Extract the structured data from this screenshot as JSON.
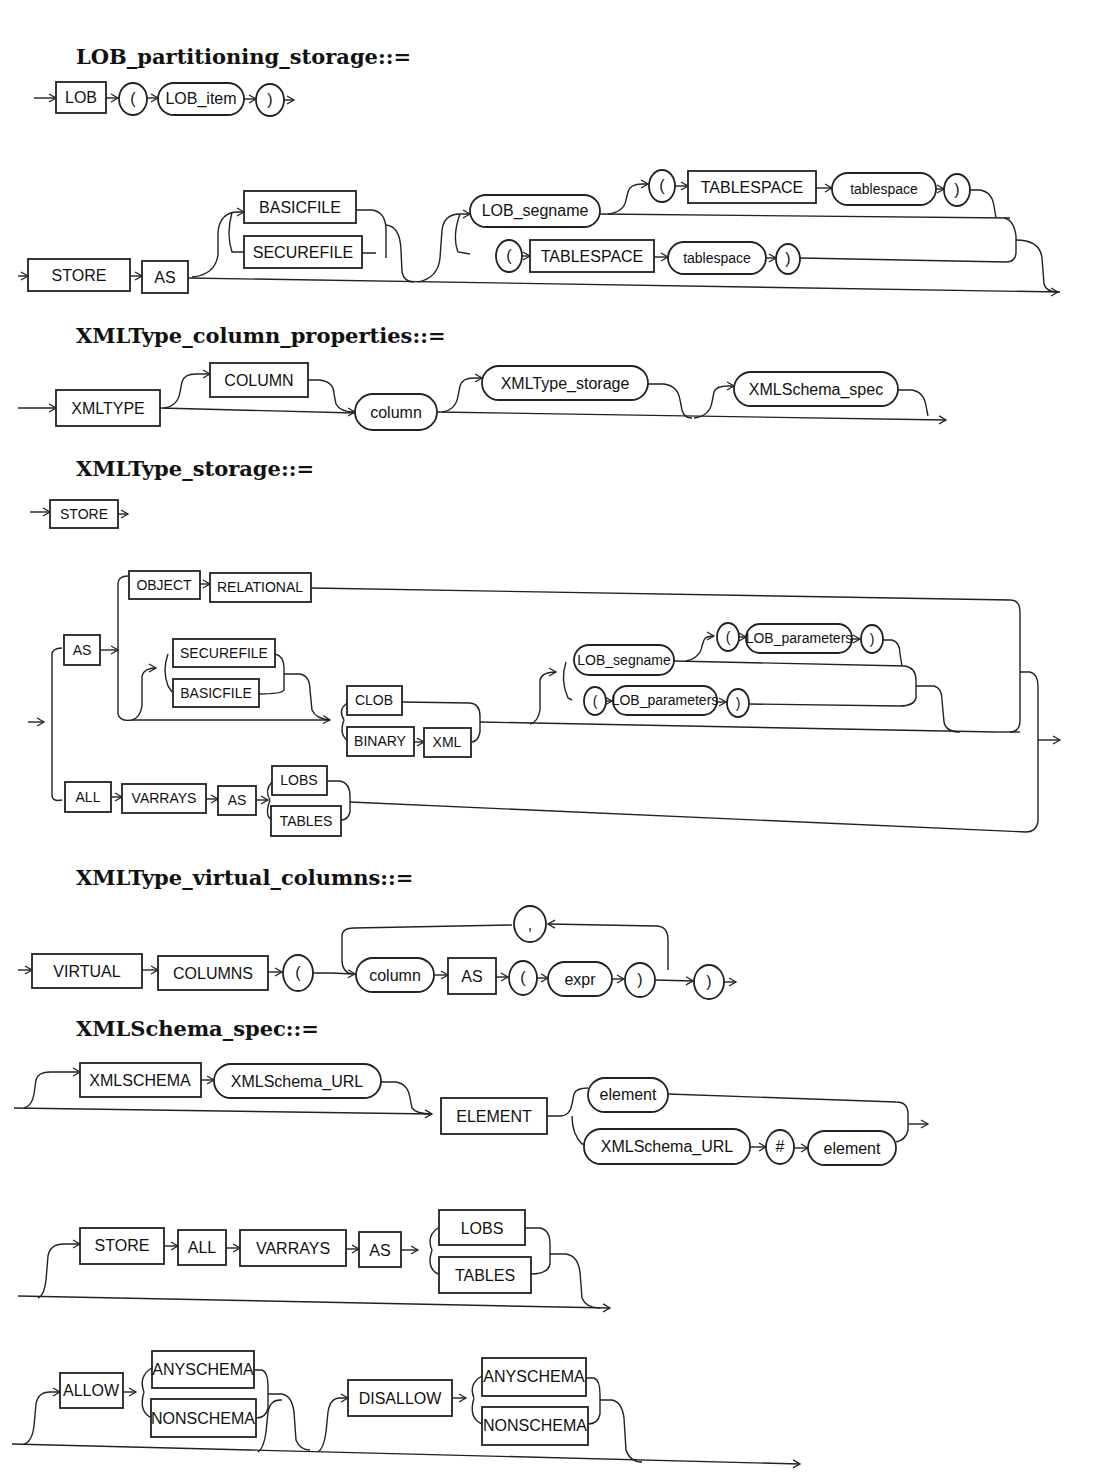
{
  "titles": {
    "lob_partitioning_storage": "LOB_partitioning_storage::=",
    "xmltype_column_properties": "XMLType_column_properties::=",
    "xmltype_storage": "XMLType_storage::=",
    "xmltype_virtual_columns": "XMLType_virtual_columns::=",
    "xmlschema_spec": "XMLSchema_spec::="
  },
  "lob_partitioning_storage": {
    "row1": {
      "kw_lob": "LOB",
      "lparen": "(",
      "lob_item": "LOB_item",
      "rparen": ")"
    },
    "row2": {
      "store": "STORE",
      "as": "AS",
      "basicfile": "BASICFILE",
      "securefile": "SECUREFILE",
      "lob_segname": "LOB_segname",
      "lparen1": "(",
      "tablespace_kw1": "TABLESPACE",
      "tablespace1": "tablespace",
      "rparen1": ")",
      "lparen2": "(",
      "tablespace_kw2": "TABLESPACE",
      "tablespace2": "tablespace",
      "rparen2": ")"
    }
  },
  "xmltype_column_properties": {
    "xmltype": "XMLTYPE",
    "column_kw": "COLUMN",
    "column": "column",
    "xmltype_storage": "XMLType_storage",
    "xmlschema_spec": "XMLSchema_spec"
  },
  "xmltype_storage": {
    "store": "STORE",
    "as1": "AS",
    "object": "OBJECT",
    "relational": "RELATIONAL",
    "securefile": "SECUREFILE",
    "basicfile": "BASICFILE",
    "clob": "CLOB",
    "binary": "BINARY",
    "xml": "XML",
    "lob_segname": "LOB_segname",
    "lparen1": "(",
    "lob_parameters1": "LOB_parameters",
    "rparen1": ")",
    "lparen2": "(",
    "lob_parameters2": "LOB_parameters",
    "rparen2": ")",
    "all": "ALL",
    "varrays": "VARRAYS",
    "as2": "AS",
    "lobs": "LOBS",
    "tables": "TABLES"
  },
  "xmltype_virtual_columns": {
    "virtual": "VIRTUAL",
    "columns": "COLUMNS",
    "lparen_outer": "(",
    "comma": ",",
    "column": "column",
    "as": "AS",
    "lparen": "(",
    "expr": "expr",
    "rparen": ")",
    "rparen_outer": ")"
  },
  "xmlschema_spec": {
    "row1": {
      "xmlschema": "XMLSCHEMA",
      "xmlschema_url": "XMLSchema_URL",
      "element_kw": "ELEMENT",
      "element1": "element",
      "xmlschema_url2": "XMLSchema_URL",
      "hash": "#",
      "element2": "element"
    },
    "row2": {
      "store": "STORE",
      "all": "ALL",
      "varrays": "VARRAYS",
      "as": "AS",
      "lobs": "LOBS",
      "tables": "TABLES"
    },
    "row3": {
      "allow": "ALLOW",
      "anyschema1": "ANYSCHEMA",
      "nonschema1": "NONSCHEMA",
      "disallow": "DISALLOW",
      "anyschema2": "ANYSCHEMA",
      "nonschema2": "NONSCHEMA"
    }
  },
  "colors": {
    "ink": "#222222",
    "background": "#ffffff"
  }
}
